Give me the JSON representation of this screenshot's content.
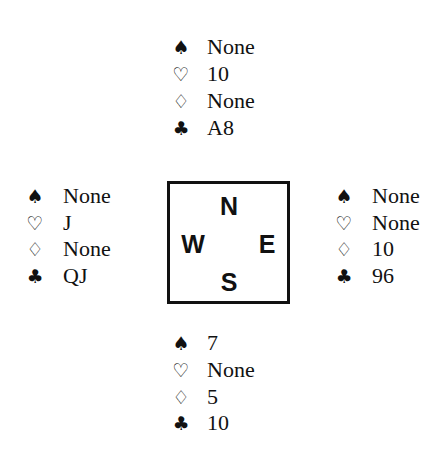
{
  "suits": {
    "spades": "♠",
    "hearts": "♡",
    "diamonds": "♢",
    "clubs": "♣"
  },
  "compass": {
    "north": "N",
    "west": "W",
    "east": "E",
    "south": "S"
  },
  "hands": {
    "north": {
      "spades": "None",
      "hearts": "10",
      "diamonds": "None",
      "clubs": "A8"
    },
    "west": {
      "spades": "None",
      "hearts": "J",
      "diamonds": "None",
      "clubs": "QJ"
    },
    "east": {
      "spades": "None",
      "hearts": "None",
      "diamonds": "10",
      "clubs": "96"
    },
    "south": {
      "spades": "7",
      "hearts": "None",
      "diamonds": "5",
      "clubs": "10"
    }
  }
}
